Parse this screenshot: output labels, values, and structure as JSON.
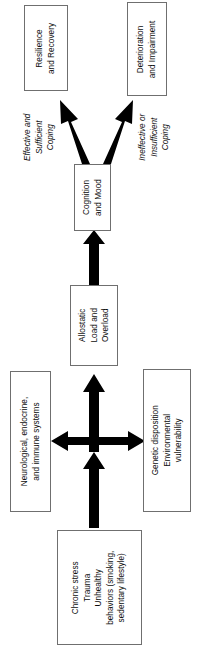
{
  "diagram": {
    "orientation": "rotated-90-counterclockwise",
    "background_color": "#ffffff",
    "box_border_color": "#6f6f6f",
    "arrow_color": "#000000",
    "text_color": "#0d0d0d",
    "nodes": [
      {
        "id": "resilience",
        "name": "resilience-and-recovery-node",
        "lines": [
          "Resilience",
          "and Recovery"
        ],
        "text": "Resilience and Recovery"
      },
      {
        "id": "deterioration",
        "name": "deterioration-and-impairment-node",
        "lines": [
          "Deterioration",
          "and Impairment"
        ],
        "text": "Deterioration and Impairment"
      },
      {
        "id": "cognition",
        "name": "cognition-and-mood-node",
        "lines": [
          "Cognition",
          "and Mood"
        ],
        "text": "Cognition and Mood"
      },
      {
        "id": "allostatic",
        "name": "allostatic-load-and-overload-node",
        "lines": [
          "Allostatic",
          "Load and",
          "Overload"
        ],
        "text": "Allostatic Load and Overload"
      },
      {
        "id": "neuro",
        "name": "neurological-endocrine-immune-node",
        "lines": [
          "Neurological, endocrine,",
          "and immune systems"
        ],
        "text": "Neurological, endocrine, and immune systems"
      },
      {
        "id": "genetic",
        "name": "genetic-environmental-node",
        "lines": [
          "Genetic disposition",
          "Environmental",
          "vulnerability"
        ],
        "text": "Genetic disposition Environmental vulnerability"
      },
      {
        "id": "stressors",
        "name": "chronic-stress-trauma-node",
        "lines": [
          "Chronic stress",
          "Trauma",
          "Unhealthy",
          "behaviors (smoking,",
          "sedentary lifestyle)"
        ],
        "text": "Chronic stress Trauma Unhealthy behaviors (smoking, sedentary lifestyle)"
      }
    ],
    "edge_labels": [
      {
        "id": "effective_coping",
        "name": "effective-sufficient-coping-label",
        "lines": [
          "Effective and",
          "Sufficient",
          "Coping"
        ],
        "text": "Effective and Sufficient Coping"
      },
      {
        "id": "ineffective_coping",
        "name": "ineffective-insufficient-coping-label",
        "lines": [
          "Ineffective or",
          "Insufficient",
          "Coping"
        ],
        "text": "Ineffective or Insufficient Coping"
      }
    ],
    "edges": [
      {
        "from": "stressors",
        "to": "junction",
        "style": "solid-block-arrow",
        "direction": "one-way"
      },
      {
        "from": "junction",
        "to": "allostatic",
        "style": "solid-block-arrow",
        "direction": "one-way"
      },
      {
        "from": "neuro",
        "to": "genetic",
        "style": "solid-block-arrow",
        "direction": "two-way"
      },
      {
        "from": "allostatic",
        "to": "cognition",
        "style": "solid-block-arrow",
        "direction": "one-way"
      },
      {
        "from": "cognition",
        "to": "resilience",
        "style": "solid-block-arrow",
        "direction": "one-way",
        "label": "effective_coping"
      },
      {
        "from": "cognition",
        "to": "deterioration",
        "style": "solid-block-arrow",
        "direction": "one-way",
        "label": "ineffective_coping"
      }
    ]
  }
}
